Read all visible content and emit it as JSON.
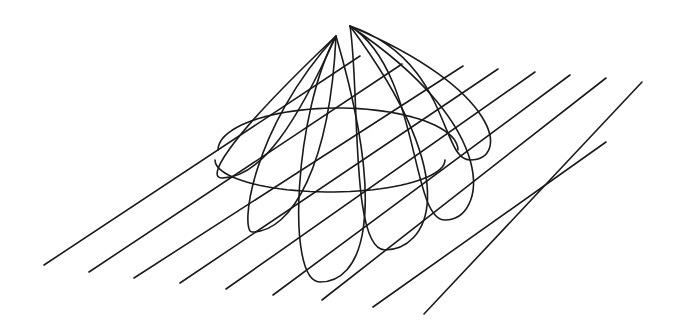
{
  "figure": {
    "width": 679,
    "height": 331,
    "background": "#ffffff",
    "stroke_color": "#1a1a1a",
    "stroke_width": 1.6
  },
  "parallel_lines": [
    {
      "x1": 44,
      "y1": 265,
      "x2": 360,
      "y2": 56
    },
    {
      "x1": 89,
      "y1": 272,
      "x2": 402,
      "y2": 64
    },
    {
      "x1": 134,
      "y1": 278,
      "x2": 463,
      "y2": 66
    },
    {
      "x1": 180,
      "y1": 283,
      "x2": 498,
      "y2": 69
    },
    {
      "x1": 226,
      "y1": 289,
      "x2": 535,
      "y2": 72
    },
    {
      "x1": 273,
      "y1": 295,
      "x2": 570,
      "y2": 75
    },
    {
      "x1": 322,
      "y1": 300,
      "x2": 606,
      "y2": 78
    },
    {
      "x1": 373,
      "y1": 307,
      "x2": 606,
      "y2": 142
    },
    {
      "x1": 424,
      "y1": 314,
      "x2": 642,
      "y2": 82
    }
  ],
  "petals": [
    {
      "apex": [
        336,
        36
      ],
      "p1": [
        218,
        148
      ],
      "bottom": [
        222,
        178
      ],
      "p2": [
        258,
        160
      ]
    },
    {
      "apex": [
        336,
        36
      ],
      "p1": [
        250,
        130
      ],
      "bottom": [
        252,
        232
      ],
      "p2": [
        290,
        205
      ]
    },
    {
      "apex": [
        336,
        36
      ],
      "p1": [
        295,
        110
      ],
      "bottom": [
        320,
        282
      ],
      "p2": [
        350,
        262
      ]
    },
    {
      "apex": [
        350,
        26
      ],
      "p1": [
        360,
        90
      ],
      "bottom": [
        385,
        250
      ],
      "p2": [
        430,
        228
      ]
    },
    {
      "apex": [
        350,
        26
      ],
      "p1": [
        420,
        70
      ],
      "bottom": [
        445,
        220
      ],
      "p2": [
        465,
        170
      ]
    },
    {
      "apex": [
        350,
        26
      ],
      "p1": [
        450,
        60
      ],
      "bottom": [
        470,
        160
      ],
      "p2": [
        462,
        130
      ]
    }
  ],
  "rings": [
    {
      "cx": 338,
      "cy": 150,
      "rx": 120,
      "ry": 42,
      "start_deg": 180,
      "end_deg": 360
    },
    {
      "cx": 330,
      "cy": 160,
      "rx": 115,
      "ry": 32,
      "start_deg": 0,
      "end_deg": 180
    }
  ]
}
